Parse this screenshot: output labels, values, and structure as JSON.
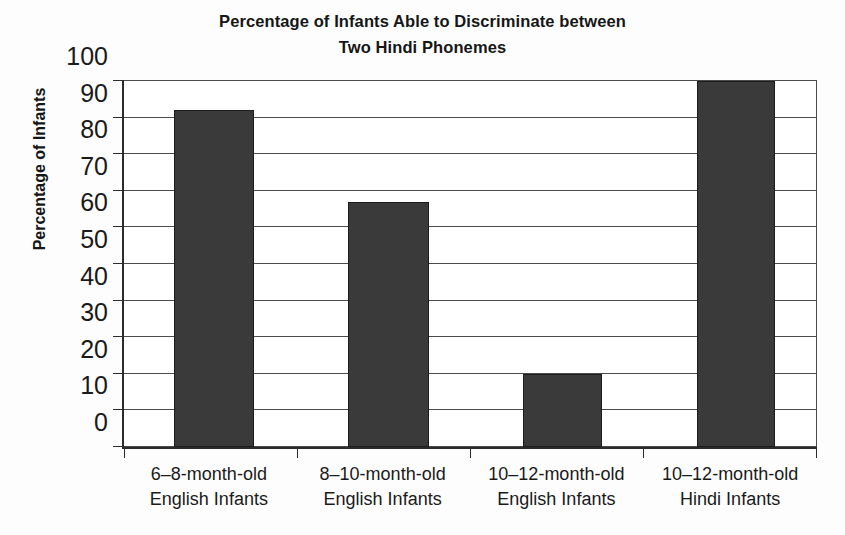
{
  "chart_data": {
    "type": "bar",
    "title": "Percentage of Infants Able to Discriminate between Two Hindi Phonemes",
    "title_lines": [
      "Percentage of Infants Able to Discriminate between",
      "Two Hindi Phonemes"
    ],
    "xlabel": "",
    "ylabel": "Percentage of Infants",
    "ylim": [
      0,
      100
    ],
    "ytick_labels": [
      "0",
      "10",
      "20",
      "30",
      "40",
      "50",
      "60",
      "70",
      "80",
      "90",
      "100"
    ],
    "ytick_values": [
      0,
      10,
      20,
      30,
      40,
      50,
      60,
      70,
      80,
      90,
      100
    ],
    "grid": "horizontal",
    "legend": "none",
    "bar_color": "#3a3a3a",
    "bar_edge_color": "#1c1c1c",
    "axis_color": "#2b2b2b",
    "gridline_color": "#4c4c4c",
    "background_color": "#fdfdfd",
    "plot_background_color": "#ffffff",
    "categories": [
      "6–8-month-old English Infants",
      "8–10-month-old English Infants",
      "10–12-month-old English Infants",
      "10–12-month-old Hindi Infants"
    ],
    "category_lines": [
      [
        "6–8-month-old",
        "English Infants"
      ],
      [
        "8–10-month-old",
        "English Infants"
      ],
      [
        "10–12-month-old",
        "English Infants"
      ],
      [
        "10–12-month-old",
        "Hindi Infants"
      ]
    ],
    "values": [
      92,
      67,
      20,
      100
    ],
    "series": [
      {
        "name": "Percentage of Infants",
        "values": [
          92,
          67,
          20,
          100
        ]
      }
    ]
  }
}
